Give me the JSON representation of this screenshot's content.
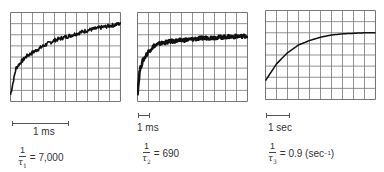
{
  "chart_data": [
    {
      "type": "line",
      "title": "",
      "grid": {
        "columns": 10,
        "rows": 8,
        "on": true
      },
      "description": "Noisy oscilloscope trace rising quickly then slowly approaching plateau",
      "x": [
        0,
        0.5,
        1,
        1.5,
        2,
        3,
        4,
        5,
        6,
        7,
        8,
        9,
        10
      ],
      "y": [
        0.6,
        3.0,
        3.6,
        4.1,
        4.4,
        5.0,
        5.5,
        5.8,
        6.1,
        6.4,
        6.6,
        6.8,
        7.0
      ],
      "xlabel": "",
      "ylabel": "",
      "scale_bar": {
        "label": "1 ms",
        "length_divisions": 5
      },
      "rate": {
        "numerator": "1",
        "tau": "τ",
        "subscript": "1",
        "value": "= 7,000"
      }
    },
    {
      "type": "line",
      "title": "",
      "grid": {
        "columns": 10,
        "rows": 8,
        "on": true
      },
      "description": "Thick noisy trace rising steeply then plateauing",
      "x": [
        0,
        0.2,
        0.5,
        1,
        1.5,
        2,
        3,
        4,
        5,
        6,
        7,
        8,
        9,
        10
      ],
      "y": [
        0.7,
        2.8,
        3.7,
        4.5,
        5.0,
        5.2,
        5.4,
        5.5,
        5.6,
        5.7,
        5.75,
        5.8,
        5.85,
        5.9
      ],
      "xlabel": "",
      "ylabel": "",
      "scale_bar": {
        "label": "1 ms",
        "length_divisions": 0.5
      },
      "rate": {
        "numerator": "1",
        "tau": "τ",
        "subscript": "2",
        "value": "= 690"
      }
    },
    {
      "type": "line",
      "title": "",
      "grid": {
        "columns": 10,
        "rows": 8,
        "on": true
      },
      "description": "Smooth exponential rise to plateau",
      "x": [
        0,
        1,
        2,
        3,
        4,
        5,
        6,
        7,
        8,
        9,
        10
      ],
      "y": [
        1.7,
        3.2,
        4.2,
        4.9,
        5.3,
        5.6,
        5.8,
        5.9,
        5.95,
        6.0,
        6.0
      ],
      "xlabel": "",
      "ylabel": "",
      "scale_bar": {
        "label": "1 sec",
        "length_divisions": 2
      },
      "rate": {
        "numerator": "1",
        "tau": "τ",
        "subscript": "3",
        "value": "= 0.9 (sec",
        "unit_exp": "−1",
        "close": ")"
      }
    }
  ]
}
